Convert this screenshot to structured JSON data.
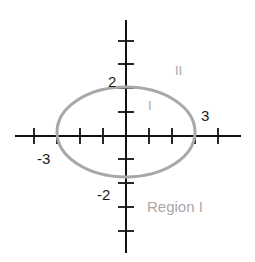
{
  "diagram": {
    "equation_hint": "x^2/9 + y^2/4 = 1",
    "axes": {
      "x_ticks": [
        -4,
        -3,
        -2,
        -1,
        1,
        2,
        3,
        4
      ],
      "y_ticks": [
        -4,
        -3,
        -2,
        -1,
        1,
        2,
        3,
        4
      ],
      "color": "#111111"
    },
    "ellipse": {
      "semi_major_x": 3,
      "semi_minor_y": 2,
      "color": "#a8a8a8"
    },
    "labels": {
      "y_pos": "2",
      "y_neg": "-2",
      "x_pos": "3",
      "x_neg": "-3",
      "region_inside": "I",
      "region_outside": "II",
      "region_caption": "Region I"
    }
  }
}
